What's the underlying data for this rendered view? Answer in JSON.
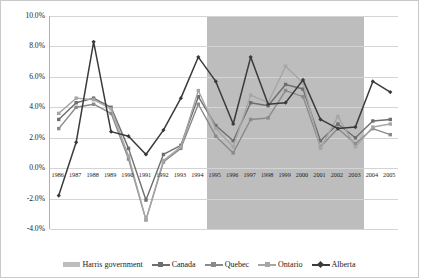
{
  "chart_data": {
    "type": "line",
    "title": "",
    "xlabel": "",
    "ylabel": "",
    "ylim": [
      -4.0,
      10.0
    ],
    "ytick_values": [
      10.0,
      8.0,
      6.0,
      4.0,
      2.0,
      0.0,
      -2.0,
      -4.0
    ],
    "ytick_labels": [
      "10.0%",
      "8.0%",
      "6.0%",
      "4.0%",
      "2.0%",
      "0.0%",
      "-2.0%",
      "-4.0%"
    ],
    "grid": true,
    "legend_position": "bottom",
    "categories": [
      "1986",
      "1987",
      "1988",
      "1989",
      "1990",
      "1991",
      "1992",
      "1993",
      "1994",
      "1995",
      "1996",
      "1997",
      "1998",
      "1999",
      "2000",
      "2001",
      "2002",
      "2003",
      "2004",
      "2005"
    ],
    "shaded_region": {
      "label": "Harris government",
      "start_category": "1995",
      "end_category": "2003",
      "color": "#bdbdbd"
    },
    "series": [
      {
        "name": "Canada",
        "color": "#6e6e6e",
        "marker": "square",
        "values": [
          3.2,
          4.3,
          4.6,
          4.0,
          1.3,
          -2.1,
          0.9,
          1.5,
          4.7,
          2.8,
          1.8,
          4.3,
          4.1,
          5.5,
          5.2,
          1.8,
          2.9,
          2.0,
          3.1,
          3.2
        ]
      },
      {
        "name": "Quebec",
        "color": "#8a8a8a",
        "marker": "square",
        "values": [
          2.6,
          4.0,
          4.2,
          3.6,
          0.6,
          -3.4,
          0.4,
          1.3,
          4.2,
          2.1,
          1.0,
          3.2,
          3.3,
          5.1,
          4.7,
          1.4,
          2.6,
          1.6,
          2.6,
          2.2
        ]
      },
      {
        "name": "Ontario",
        "color": "#a6a6a6",
        "marker": "square",
        "values": [
          3.6,
          4.6,
          4.5,
          3.9,
          0.8,
          -3.4,
          0.5,
          1.4,
          5.1,
          2.6,
          1.4,
          4.8,
          4.3,
          6.7,
          5.6,
          1.3,
          3.4,
          1.4,
          2.7,
          2.9
        ]
      },
      {
        "name": "Alberta",
        "color": "#3a3a3a",
        "marker": "diamond",
        "values": [
          -1.8,
          1.7,
          8.3,
          2.4,
          2.1,
          0.9,
          2.5,
          4.6,
          7.3,
          5.7,
          2.9,
          7.3,
          4.2,
          4.3,
          5.8,
          3.2,
          2.6,
          2.7,
          5.7,
          5.0
        ]
      }
    ],
    "legend": [
      {
        "name": "Harris government",
        "type": "area",
        "color": "#bdbdbd"
      },
      {
        "name": "Canada",
        "type": "line",
        "color": "#6e6e6e"
      },
      {
        "name": "Quebec",
        "type": "line",
        "color": "#8a8a8a"
      },
      {
        "name": "Ontario",
        "type": "line",
        "color": "#a6a6a6"
      },
      {
        "name": "Alberta",
        "type": "line",
        "color": "#3a3a3a"
      }
    ]
  }
}
